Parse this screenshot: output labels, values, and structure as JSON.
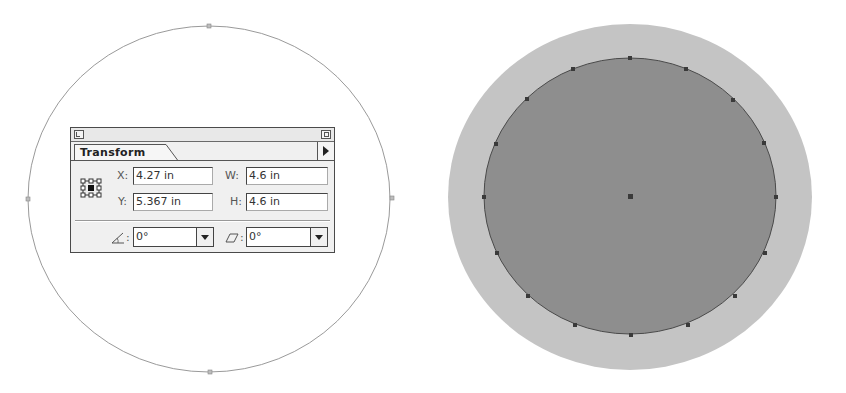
{
  "canvas": {
    "background": "#ffffff",
    "left_object": {
      "shape": "ellipse-path",
      "stroke": "#9a9a9a",
      "fill": "none",
      "anchor_points": 4
    },
    "right_object": {
      "outer_fill": "#c4c4c4",
      "inner_fill": "#8e8e8e",
      "inner_stroke": "#4a4a4a",
      "anchor_points": 16,
      "center_point": true
    }
  },
  "transform_panel": {
    "tab_label": "Transform",
    "fields": {
      "x": {
        "label": "X:",
        "value": "4.27 in"
      },
      "y": {
        "label": "Y:",
        "value": "5.367 in"
      },
      "w": {
        "label": "W:",
        "value": "4.6 in"
      },
      "h": {
        "label": "H:",
        "value": "4.6 in"
      }
    },
    "rotate": {
      "label": ":",
      "icon": "rotate-angle-icon",
      "value": "0°"
    },
    "shear": {
      "label": ":",
      "icon": "shear-icon",
      "value": "0°"
    },
    "reference_point": {
      "selected": "center"
    },
    "icons": {
      "collapse": "collapse-box-icon",
      "zoom": "zoom-box-icon",
      "menu": "panel-menu-arrow-icon"
    }
  }
}
